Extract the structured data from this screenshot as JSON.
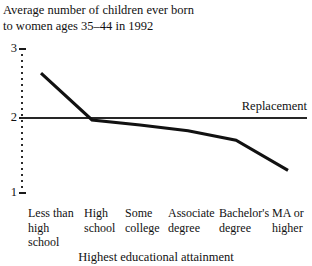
{
  "chart_data": {
    "type": "line",
    "title": "Average number of children ever born\nto women ages 35–44 in 1992",
    "xlabel": "Highest educational attainment",
    "ylabel": "",
    "ylim": [
      1,
      3
    ],
    "yticks": [
      3,
      2,
      1
    ],
    "ytick_labels": [
      "3",
      "2",
      "1"
    ],
    "grid": false,
    "legend": "none",
    "categories": [
      "Less than\nhigh\nschool",
      "High\nschool",
      "Some\ncollege",
      "Associate\ndegree",
      "Bachelor's\ndegree",
      "MA or\nhigher"
    ],
    "values": [
      2.65,
      2.0,
      1.93,
      1.85,
      1.72,
      1.3
    ],
    "series": [
      {
        "name": "Children ever born",
        "values": [
          2.65,
          2.0,
          1.93,
          1.85,
          1.72,
          1.3
        ]
      }
    ],
    "annotations": [
      {
        "name": "replacement",
        "label": "Replacement",
        "type": "hline",
        "y": 2.0
      }
    ]
  },
  "colors": {
    "data_line": "#111111",
    "axis": "#2b2b2b",
    "replacement_line": "#262626",
    "background": "#ffffff"
  }
}
